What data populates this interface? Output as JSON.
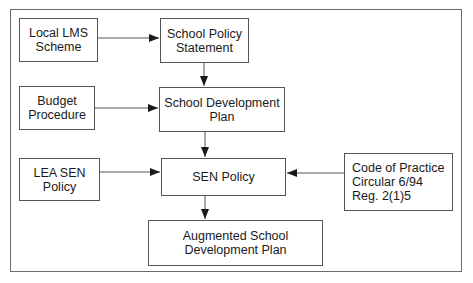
{
  "diagram": {
    "type": "flowchart",
    "nodes": [
      {
        "id": "local-lms-scheme",
        "label": "Local LMS\nScheme"
      },
      {
        "id": "school-policy-statement",
        "label": "School Policy\nStatement"
      },
      {
        "id": "budget-procedure",
        "label": "Budget\nProcedure"
      },
      {
        "id": "school-development-plan",
        "label": "School Development\nPlan"
      },
      {
        "id": "lea-sen-policy",
        "label": "LEA SEN\nPolicy"
      },
      {
        "id": "sen-policy",
        "label": "SEN Policy"
      },
      {
        "id": "code-of-practice",
        "label": "Code of Practice\nCircular 6/94\nReg. 2(1)5"
      },
      {
        "id": "augmented-plan",
        "label": "Augmented School\nDevelopment Plan"
      }
    ],
    "edges": [
      {
        "from": "local-lms-scheme",
        "to": "school-policy-statement"
      },
      {
        "from": "school-policy-statement",
        "to": "school-development-plan"
      },
      {
        "from": "budget-procedure",
        "to": "school-development-plan"
      },
      {
        "from": "school-development-plan",
        "to": "sen-policy"
      },
      {
        "from": "lea-sen-policy",
        "to": "sen-policy"
      },
      {
        "from": "code-of-practice",
        "to": "sen-policy"
      },
      {
        "from": "sen-policy",
        "to": "augmented-plan"
      }
    ],
    "colors": {
      "line": "#555555",
      "frame": "#6a6a6a",
      "background": "#ffffff"
    }
  }
}
